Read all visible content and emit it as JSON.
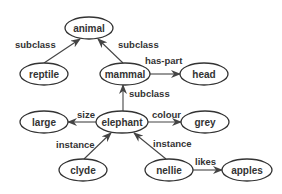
{
  "diagram": {
    "nodes": [
      {
        "id": "animal",
        "label": "animal",
        "cx": 89,
        "cy": 28,
        "rx": 24,
        "ry": 11
      },
      {
        "id": "reptile",
        "label": "reptile",
        "cx": 44,
        "cy": 74,
        "rx": 24,
        "ry": 11
      },
      {
        "id": "mammal",
        "label": "mammal",
        "cx": 125,
        "cy": 74,
        "rx": 25,
        "ry": 11
      },
      {
        "id": "head",
        "label": "head",
        "cx": 204,
        "cy": 74,
        "rx": 24,
        "ry": 11
      },
      {
        "id": "large",
        "label": "large",
        "cx": 44,
        "cy": 122,
        "rx": 24,
        "ry": 11
      },
      {
        "id": "elephant",
        "label": "elephant",
        "cx": 122,
        "cy": 122,
        "rx": 26,
        "ry": 11
      },
      {
        "id": "grey",
        "label": "grey",
        "cx": 205,
        "cy": 122,
        "rx": 24,
        "ry": 11
      },
      {
        "id": "clyde",
        "label": "clyde",
        "cx": 83,
        "cy": 170,
        "rx": 24,
        "ry": 11
      },
      {
        "id": "nellie",
        "label": "nellie",
        "cx": 169,
        "cy": 170,
        "rx": 24,
        "ry": 11
      },
      {
        "id": "apples",
        "label": "apples",
        "cx": 247,
        "cy": 170,
        "rx": 25,
        "ry": 11
      }
    ],
    "edges": [
      {
        "from": "reptile",
        "to": "animal",
        "label": "subclass",
        "x1": 44,
        "y1": 63,
        "x2": 80,
        "y2": 39,
        "lx": 15,
        "ly": 44,
        "anchor": "start"
      },
      {
        "from": "mammal",
        "to": "animal",
        "label": "subclass",
        "x1": 123,
        "y1": 63,
        "x2": 98,
        "y2": 39,
        "lx": 118,
        "ly": 44,
        "anchor": "start"
      },
      {
        "from": "mammal",
        "to": "head",
        "label": "has-part",
        "x1": 150,
        "y1": 74,
        "x2": 180,
        "y2": 74,
        "lx": 145,
        "ly": 60,
        "anchor": "start"
      },
      {
        "from": "elephant",
        "to": "mammal",
        "label": "subclass",
        "x1": 123,
        "y1": 111,
        "x2": 123,
        "y2": 85,
        "lx": 129,
        "ly": 93,
        "anchor": "start"
      },
      {
        "from": "elephant",
        "to": "large",
        "label": "size",
        "x1": 96,
        "y1": 122,
        "x2": 68,
        "y2": 122,
        "lx": 77,
        "ly": 114,
        "anchor": "start"
      },
      {
        "from": "elephant",
        "to": "grey",
        "label": "colour",
        "x1": 148,
        "y1": 122,
        "x2": 181,
        "y2": 122,
        "lx": 152,
        "ly": 114,
        "anchor": "start"
      },
      {
        "from": "clyde",
        "to": "elephant",
        "label": "instance",
        "x1": 84,
        "y1": 159,
        "x2": 111,
        "y2": 133,
        "lx": 56,
        "ly": 144,
        "anchor": "start"
      },
      {
        "from": "nellie",
        "to": "elephant",
        "label": "instance",
        "x1": 166,
        "y1": 159,
        "x2": 134,
        "y2": 133,
        "lx": 153,
        "ly": 143,
        "anchor": "start"
      },
      {
        "from": "nellie",
        "to": "apples",
        "label": "likes",
        "x1": 193,
        "y1": 170,
        "x2": 222,
        "y2": 170,
        "lx": 195,
        "ly": 161,
        "anchor": "start"
      }
    ]
  }
}
